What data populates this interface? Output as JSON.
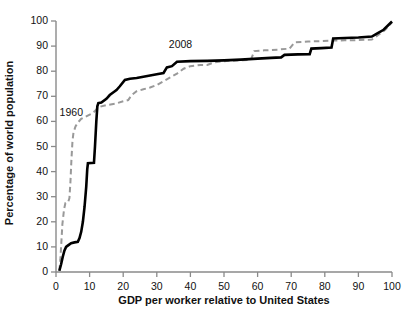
{
  "chart_data": {
    "type": "line",
    "title": "",
    "xlabel": "GDP per worker relative to United States",
    "ylabel": "Percentage of world population",
    "xlim": [
      0,
      100
    ],
    "ylim": [
      0,
      100
    ],
    "xticks": [
      0,
      10,
      20,
      30,
      40,
      50,
      60,
      70,
      80,
      90,
      100
    ],
    "yticks": [
      0,
      10,
      20,
      30,
      40,
      50,
      60,
      70,
      80,
      90,
      100
    ],
    "grid": false,
    "legend_position": "inline-annotation",
    "annotations": [
      {
        "text": "1960",
        "x": 4.5,
        "y": 63
      },
      {
        "text": "2008",
        "x": 37,
        "y": 90
      }
    ],
    "series": [
      {
        "name": "1960",
        "style": "dashed",
        "color": "#999999",
        "points": [
          [
            1.0,
            0.5
          ],
          [
            1.3,
            5.0
          ],
          [
            1.6,
            12.0
          ],
          [
            1.9,
            19.0
          ],
          [
            2.4,
            25.0
          ],
          [
            2.8,
            27.5
          ],
          [
            3.6,
            27.8
          ],
          [
            4.0,
            29.5
          ],
          [
            4.3,
            36.0
          ],
          [
            4.6,
            45.0
          ],
          [
            4.9,
            52.0
          ],
          [
            5.2,
            55.5
          ],
          [
            5.8,
            58.0
          ],
          [
            6.5,
            59.5
          ],
          [
            7.5,
            61.0
          ],
          [
            9.0,
            62.0
          ],
          [
            10.5,
            63.0
          ],
          [
            11.5,
            64.0
          ],
          [
            12.5,
            65.5
          ],
          [
            13.5,
            66.0
          ],
          [
            15.0,
            66.5
          ],
          [
            17.5,
            67.0
          ],
          [
            20.0,
            68.0
          ],
          [
            21.5,
            68.5
          ],
          [
            22.5,
            70.5
          ],
          [
            24.0,
            72.0
          ],
          [
            26.0,
            72.8
          ],
          [
            28.0,
            73.5
          ],
          [
            30.0,
            74.5
          ],
          [
            32.0,
            76.0
          ],
          [
            34.0,
            77.5
          ],
          [
            36.0,
            79.0
          ],
          [
            38.0,
            81.0
          ],
          [
            40.0,
            82.0
          ],
          [
            43.0,
            82.5
          ],
          [
            45.0,
            82.5
          ],
          [
            47.0,
            83.5
          ],
          [
            50.0,
            84.0
          ],
          [
            54.0,
            84.3
          ],
          [
            58.0,
            84.5
          ],
          [
            59.0,
            88.0
          ],
          [
            62.0,
            88.3
          ],
          [
            66.0,
            88.6
          ],
          [
            69.5,
            89.0
          ],
          [
            71.0,
            91.5
          ],
          [
            75.0,
            91.8
          ],
          [
            79.0,
            92.0
          ],
          [
            83.0,
            92.2
          ],
          [
            86.0,
            92.3
          ],
          [
            90.0,
            92.4
          ],
          [
            94.0,
            92.6
          ],
          [
            96.0,
            94.5
          ],
          [
            98.0,
            96.5
          ],
          [
            100.0,
            99.5
          ]
        ]
      },
      {
        "name": "2008",
        "style": "solid",
        "color": "#000000",
        "points": [
          [
            1.0,
            0.5
          ],
          [
            1.5,
            3.0
          ],
          [
            2.0,
            6.0
          ],
          [
            2.5,
            8.5
          ],
          [
            3.0,
            10.0
          ],
          [
            3.5,
            10.5
          ],
          [
            4.5,
            11.5
          ],
          [
            5.5,
            11.8
          ],
          [
            6.5,
            12.0
          ],
          [
            7.0,
            13.5
          ],
          [
            7.5,
            16.0
          ],
          [
            8.0,
            20.0
          ],
          [
            8.5,
            26.0
          ],
          [
            9.0,
            34.0
          ],
          [
            9.3,
            41.0
          ],
          [
            9.5,
            43.3
          ],
          [
            11.3,
            43.5
          ],
          [
            11.6,
            50.0
          ],
          [
            12.0,
            60.0
          ],
          [
            12.3,
            66.0
          ],
          [
            12.6,
            67.3
          ],
          [
            13.5,
            67.5
          ],
          [
            15.0,
            69.0
          ],
          [
            16.0,
            70.5
          ],
          [
            17.0,
            71.5
          ],
          [
            18.0,
            72.5
          ],
          [
            19.0,
            74.0
          ],
          [
            20.5,
            76.5
          ],
          [
            22.0,
            77.0
          ],
          [
            24.0,
            77.3
          ],
          [
            26.0,
            77.8
          ],
          [
            28.0,
            78.3
          ],
          [
            30.0,
            78.8
          ],
          [
            32.0,
            79.3
          ],
          [
            33.0,
            81.5
          ],
          [
            34.5,
            82.0
          ],
          [
            36.0,
            83.8
          ],
          [
            40.0,
            84.0
          ],
          [
            45.0,
            84.1
          ],
          [
            50.0,
            84.3
          ],
          [
            55.0,
            84.6
          ],
          [
            60.0,
            85.0
          ],
          [
            64.0,
            85.3
          ],
          [
            67.0,
            85.5
          ],
          [
            68.0,
            86.5
          ],
          [
            72.0,
            86.7
          ],
          [
            75.5,
            86.8
          ],
          [
            76.0,
            89.0
          ],
          [
            79.0,
            89.2
          ],
          [
            82.0,
            89.4
          ],
          [
            82.5,
            93.0
          ],
          [
            86.0,
            93.2
          ],
          [
            90.0,
            93.4
          ],
          [
            94.0,
            93.8
          ],
          [
            95.5,
            95.0
          ],
          [
            97.5,
            96.5
          ],
          [
            100.0,
            99.8
          ]
        ]
      }
    ]
  },
  "axes": {
    "axis_color": "#8a8a8a",
    "tick_color": "#8a8a8a"
  }
}
